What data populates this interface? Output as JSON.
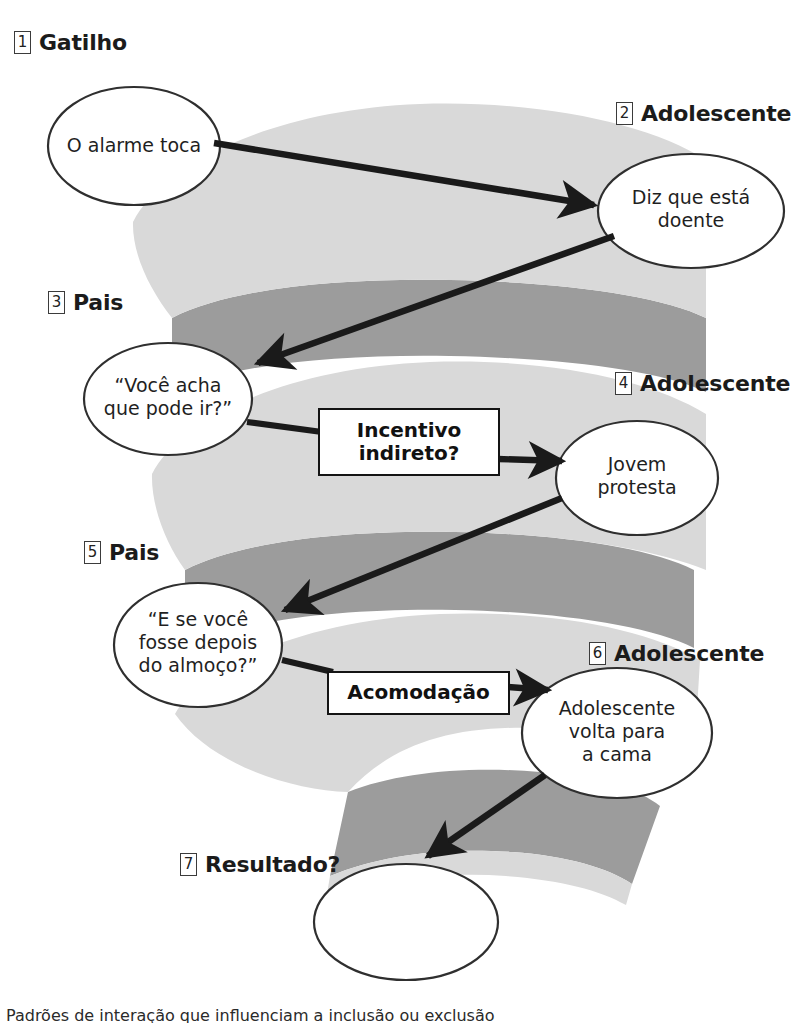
{
  "figure": {
    "type": "spiral-interaction-flow-diagram",
    "language": "pt-BR",
    "colors": {
      "band_light": "#d9d9d9",
      "band_dark": "#9c9c9c",
      "ellipse_stroke": "#2f2f2f",
      "arrow": "#1a1a1a",
      "text": "#1b1b1b",
      "background": "#ffffff"
    }
  },
  "steps": [
    {
      "num": "1",
      "title": "Gatilho",
      "node": "O alarme toca"
    },
    {
      "num": "2",
      "title": "Adolescente",
      "node": "Diz que está\ndoente"
    },
    {
      "num": "3",
      "title": "Pais",
      "node": "“Você acha\nque pode ir?”"
    },
    {
      "num": "4",
      "title": "Adolescente",
      "node": "Jovem\nprotesta"
    },
    {
      "num": "5",
      "title": "Pais",
      "node": "“E se você\nfosse depois\ndo almoço?”"
    },
    {
      "num": "6",
      "title": "Adolescente",
      "node": "Adolescente\nvolta para\na cama"
    },
    {
      "num": "7",
      "title": "Resultado?",
      "node": ""
    }
  ],
  "tags": [
    {
      "id": "tag-incentivo",
      "label": "Incentivo\nindireto?"
    },
    {
      "id": "tag-acomodacao",
      "label": "Acomodação"
    }
  ],
  "caption": "Padrões de interação que influenciam a inclusão ou exclusão"
}
